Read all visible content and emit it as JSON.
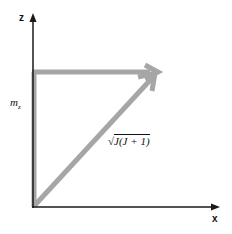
{
  "diagram": {
    "axes": {
      "z_label": "z",
      "x_label": "x"
    },
    "labels": {
      "mz": "m",
      "mz_sub": "z",
      "magnitude": "J(J + 1)",
      "magnitude_radical": "√"
    },
    "colors": {
      "axis": "#1a1a1a",
      "vector": "#a6a6a6"
    }
  }
}
